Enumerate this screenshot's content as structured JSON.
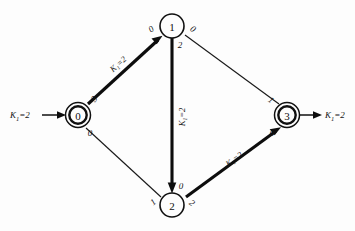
{
  "figure": {
    "kind": "state-transition-graph",
    "background_color": "#fdfdfd",
    "ink_color": "#0d0d0d"
  },
  "nodes": [
    {
      "id": "0",
      "label": "0",
      "x": 78,
      "y": 115,
      "accepting": true,
      "shape": "double-circle"
    },
    {
      "id": "1",
      "label": "1",
      "x": 172,
      "y": 26,
      "accepting": false,
      "shape": "circle"
    },
    {
      "id": "2",
      "label": "2",
      "x": 172,
      "y": 205,
      "accepting": false,
      "shape": "circle"
    },
    {
      "id": "3",
      "label": "3",
      "x": 287,
      "y": 115,
      "accepting": true,
      "shape": "double-circle"
    }
  ],
  "edges": [
    {
      "id": "e-0-1",
      "from": "0",
      "to": "1",
      "style": "bold",
      "arrow": true,
      "weight": "K₁=2",
      "tail_symbol": "3",
      "head_symbol": "0"
    },
    {
      "id": "e-1-2",
      "from": "1",
      "to": "2",
      "style": "bold",
      "arrow": true,
      "weight": "K₁=2",
      "tail_symbol": "2",
      "head_symbol": "0"
    },
    {
      "id": "e-2-3",
      "from": "2",
      "to": "3",
      "style": "bold",
      "arrow": true,
      "weight": "K₁=2",
      "tail_symbol": "2",
      "head_symbol": "0"
    },
    {
      "id": "e-0-2",
      "from": "0",
      "to": "2",
      "style": "thin",
      "arrow": false,
      "weight": "",
      "tail_symbol": "0",
      "head_symbol": "1"
    },
    {
      "id": "e-1-3",
      "from": "1",
      "to": "3",
      "style": "thin",
      "arrow": false,
      "weight": "",
      "tail_symbol": "0",
      "head_symbol": "1"
    }
  ],
  "io_arrows": [
    {
      "id": "input-arrow",
      "target": "0",
      "direction": "in",
      "label": "K₁=2",
      "label_base": "K",
      "label_sub": "1",
      "label_rest": "=2"
    },
    {
      "id": "output-arrow",
      "target": "3",
      "direction": "out",
      "label": "K₁=2",
      "label_base": "K",
      "label_sub": "1",
      "label_rest": "=2"
    }
  ],
  "edge_weight_labels": {
    "w_0_1": "K₁=2",
    "w_1_2": "K₁=2",
    "w_2_3": "K₁=2"
  },
  "symbol_labels": {
    "n1_left": "0",
    "n1_right": "0",
    "n1_below": "2",
    "n0_upper": "3",
    "n0_lower": "0",
    "n2_above": "0",
    "n2_left": "1",
    "n2_right": "2",
    "n3_upper": "1",
    "n3_lower": "0"
  }
}
